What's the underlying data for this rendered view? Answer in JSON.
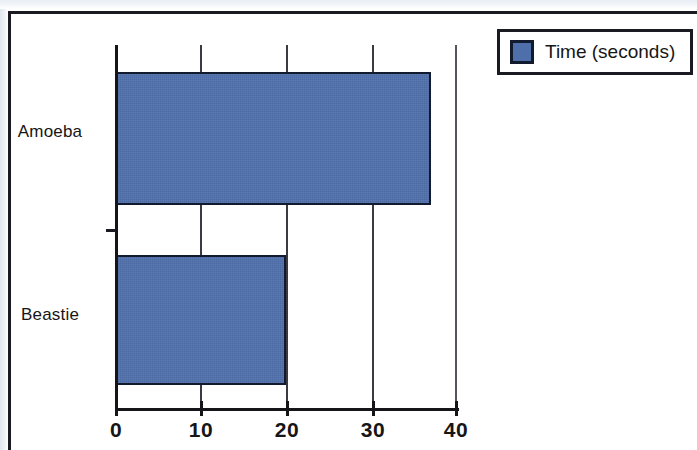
{
  "chart_data": {
    "type": "bar",
    "orientation": "horizontal",
    "title": "",
    "xlabel": "",
    "ylabel": "",
    "categories": [
      "Amoeba",
      "Beastie"
    ],
    "series": [
      {
        "name": "Time (seconds)",
        "color": "#4F6FAB",
        "values": [
          37,
          20
        ]
      }
    ],
    "xlim": [
      0,
      40
    ],
    "xticks": [
      0,
      10,
      20,
      30,
      40
    ],
    "xtick_labels": [
      "0",
      "10",
      "20",
      "30",
      "40"
    ],
    "grid": true,
    "grid_axis": "x",
    "legend": {
      "position": "top-right",
      "entries": [
        {
          "label": "Time (seconds)",
          "color": "#4F6FAB"
        }
      ]
    }
  },
  "legend": {
    "label": "Time (seconds)"
  },
  "axis": {
    "ticks": [
      {
        "label": "0",
        "value": 0
      },
      {
        "label": "10",
        "value": 10
      },
      {
        "label": "20",
        "value": 20
      },
      {
        "label": "30",
        "value": 30
      },
      {
        "label": "40",
        "value": 40
      }
    ]
  },
  "bars": [
    {
      "category": "Amoeba",
      "value": 37
    },
    {
      "category": "Beastie",
      "value": 20
    }
  ],
  "colors": {
    "bar_fill": "#4F6FAB",
    "bar_outline": "#121A2E",
    "axis": "#141419",
    "text": "#161616",
    "frame": "#1A1A22",
    "background": "#FFFFFF"
  }
}
